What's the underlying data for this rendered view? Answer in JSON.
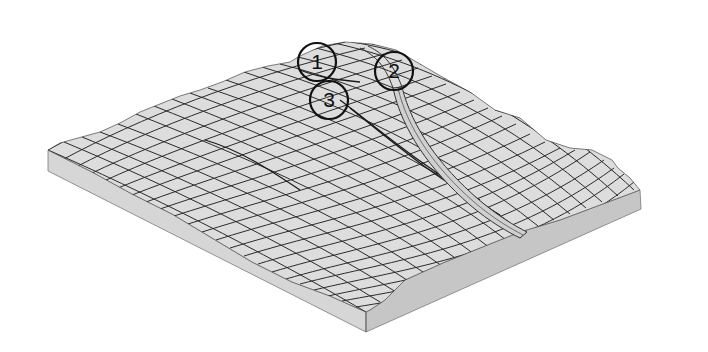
{
  "figure": {
    "type": "3d-terrain-wireframe-block",
    "colors": {
      "background": "#ffffff",
      "surface": "#dcdcdc",
      "side_front": "#c9c9c9",
      "side_left": "#d6d6d6",
      "mesh_line": "#2a2a2a",
      "channel": "#cfcfcf",
      "callout_stroke": "#111111"
    },
    "callouts": [
      {
        "id": "1",
        "label": "1",
        "cx": 317,
        "cy": 62,
        "r": 19
      },
      {
        "id": "2",
        "label": "2",
        "cx": 394,
        "cy": 71,
        "r": 19
      },
      {
        "id": "3",
        "label": "3",
        "cx": 329,
        "cy": 100,
        "r": 19
      }
    ]
  }
}
